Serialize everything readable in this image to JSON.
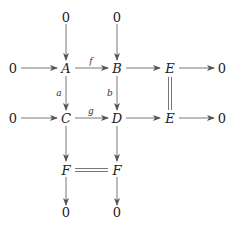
{
  "diagram": {
    "type": "commutative-diagram",
    "nodes": {
      "zero_top_a": "0",
      "zero_top_b": "0",
      "zero_left_a": "0",
      "A": "A",
      "B": "B",
      "E1": "E",
      "zero_right_e1": "0",
      "zero_left_c": "0",
      "C": "C",
      "D": "D",
      "E2": "E",
      "zero_right_e2": "0",
      "F1": "F",
      "F2": "F",
      "zero_bottom_f1": "0",
      "zero_bottom_f2": "0"
    },
    "labels": {
      "f": "f",
      "g": "g",
      "a": "a",
      "b": "b"
    },
    "edges": [
      {
        "from": "zero_top_a",
        "to": "A",
        "style": "arrow"
      },
      {
        "from": "zero_top_b",
        "to": "B",
        "style": "arrow"
      },
      {
        "from": "zero_left_a",
        "to": "A",
        "style": "arrow"
      },
      {
        "from": "A",
        "to": "B",
        "style": "arrow",
        "label": "f"
      },
      {
        "from": "B",
        "to": "E1",
        "style": "arrow"
      },
      {
        "from": "E1",
        "to": "zero_right_e1",
        "style": "arrow"
      },
      {
        "from": "A",
        "to": "C",
        "style": "arrow",
        "label": "a"
      },
      {
        "from": "B",
        "to": "D",
        "style": "arrow",
        "label": "b"
      },
      {
        "from": "E1",
        "to": "E2",
        "style": "double-line"
      },
      {
        "from": "zero_left_c",
        "to": "C",
        "style": "arrow"
      },
      {
        "from": "C",
        "to": "D",
        "style": "arrow",
        "label": "g"
      },
      {
        "from": "D",
        "to": "E2",
        "style": "arrow"
      },
      {
        "from": "E2",
        "to": "zero_right_e2",
        "style": "arrow"
      },
      {
        "from": "C",
        "to": "F1",
        "style": "arrow"
      },
      {
        "from": "D",
        "to": "F2",
        "style": "arrow"
      },
      {
        "from": "F1",
        "to": "F2",
        "style": "double-line"
      },
      {
        "from": "F1",
        "to": "zero_bottom_f1",
        "style": "arrow"
      },
      {
        "from": "F2",
        "to": "zero_bottom_f2",
        "style": "arrow"
      }
    ],
    "colors": {
      "ink": "#222222",
      "arrow": "#555555"
    }
  }
}
